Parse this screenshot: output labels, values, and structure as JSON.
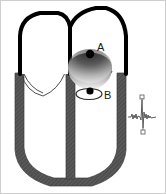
{
  "figure": {
    "background_color": "#ffffff",
    "frame_color": "#cfcfcf"
  },
  "labels": {
    "point_a": "A",
    "point_b": "B"
  },
  "structures": {
    "atria_outline_color": "#000000",
    "ventricle_wall_color": "#555555",
    "ventricle_wall_texture": "diagonal-hatch",
    "valve_leaflet_color": "#333333",
    "node_marker_color": "#000000",
    "sphere_gradient_top": "#3a3a3a",
    "sphere_gradient_bottom": "#f2f2f2",
    "ecg_trace_color": "#555555"
  },
  "parts": [
    {
      "name": "left-atrium",
      "shape": "rounded-dome-outline"
    },
    {
      "name": "right-atrium",
      "shape": "rounded-dome-outline"
    },
    {
      "name": "interatrial-septum",
      "shape": "vertical-thick-line"
    },
    {
      "name": "av-node-sphere",
      "shape": "gradient-sphere"
    },
    {
      "name": "point-a-marker",
      "shape": "filled-dot"
    },
    {
      "name": "point-b-marker",
      "shape": "filled-dot"
    },
    {
      "name": "point-b-loop",
      "shape": "ellipse-outline"
    },
    {
      "name": "mitral-valve-leaflets",
      "shape": "v-curves"
    },
    {
      "name": "tricuspid-valve-leaflets",
      "shape": "v-curves"
    },
    {
      "name": "ventricular-walls",
      "shape": "u-shaped-band"
    },
    {
      "name": "interventricular-septum",
      "shape": "vertical-band"
    },
    {
      "name": "ecg-trace",
      "shape": "qrs-waveform"
    },
    {
      "name": "ecg-top-marker",
      "shape": "small-square"
    },
    {
      "name": "ecg-bottom-marker",
      "shape": "small-square"
    }
  ]
}
